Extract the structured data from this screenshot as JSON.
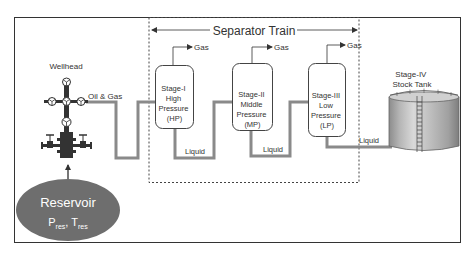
{
  "diagram": {
    "title": "Separator Train",
    "colors": {
      "line": "#555555",
      "pipe": "#8a8a8a",
      "vessel_border": "#444444",
      "reservoir_fill": "#6e6e6e",
      "reservoir_text": "#ffffff",
      "tank_body": "#a8a8a8",
      "tank_highlight": "#cfcfcf"
    },
    "wellhead": {
      "label": "Wellhead",
      "flow_label": "Oil & Gas"
    },
    "reservoir": {
      "label": "Reservoir",
      "p": "P",
      "p_sub": "res",
      "sep": ",",
      "t": "T",
      "t_sub": "res"
    },
    "separators": [
      {
        "lines": [
          "Stage-I",
          "High",
          "Pressure",
          "(HP)"
        ],
        "gas_label": "Gas",
        "liquid_label": "Liquid"
      },
      {
        "lines": [
          "Stage-II",
          "Middle",
          "Pressure",
          "(MP)"
        ],
        "gas_label": "Gas",
        "liquid_label": "Liquid"
      },
      {
        "lines": [
          "Stage-III",
          "Low",
          "Pressure",
          "(LP)"
        ],
        "gas_label": "Gas",
        "liquid_label": "Liquid"
      }
    ],
    "stock_tank": {
      "lines": [
        "Stage-IV",
        "Stock Tank"
      ]
    }
  }
}
